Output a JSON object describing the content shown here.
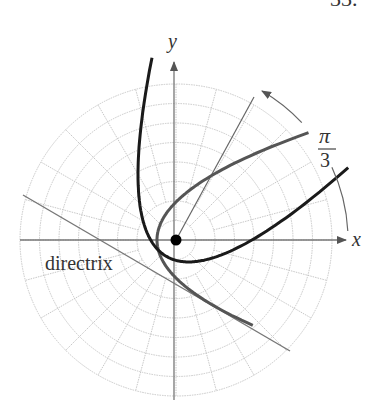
{
  "figure": {
    "header_fragment": "33.",
    "axis_labels": {
      "x": "x",
      "y": "y"
    },
    "rotation_label": {
      "numerator": "π",
      "denominator": "3"
    },
    "directrix_label": "directrix",
    "focus": {
      "cx": 176,
      "cy": 240
    },
    "polar_grid": {
      "rings": 8,
      "ring_spacing_px": 19.5,
      "spoke_step_deg": 15,
      "outer_radius_px": 156
    },
    "parabola_p_px": 38,
    "rotation_deg": 60,
    "colors": {
      "original_curve": "#555555",
      "rotated_curve": "#1a1a1a",
      "grid": "#c8c8c8",
      "axes": "#777777",
      "directrix": "#777777"
    }
  }
}
